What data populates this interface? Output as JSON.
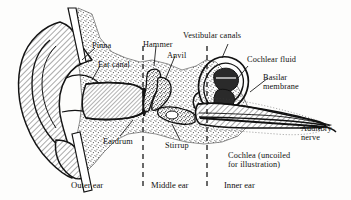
{
  "figure": {
    "background_color": "#fdfdfc",
    "ink_color": "#111111"
  },
  "labels": {
    "pinna": "Pinna",
    "ear_canal": "Ear canal",
    "eardrum": "Eardrum",
    "hammer": "Hammer",
    "anvil": "Anvil",
    "stirrup": "Stirrup",
    "vestibular_canals": "Vestibular canals",
    "cochlear_fluid": "Cochlear fluid",
    "basilar_membrane_line1": "Basilar",
    "basilar_membrane_line2": "membrane",
    "auditory_nerve_line1": "Auditory",
    "auditory_nerve_line2": "nerve",
    "cochlea_note_line1": "Cochlea (uncoiled",
    "cochlea_note_line2": "for illustration)"
  },
  "sections": {
    "outer": "Outer ear",
    "middle": "Middle ear",
    "inner": "Inner ear"
  }
}
